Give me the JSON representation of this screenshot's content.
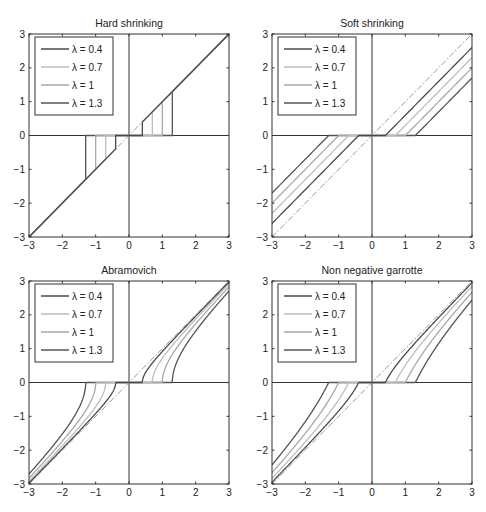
{
  "figure": {
    "layout": {
      "rows": 2,
      "cols": 2
    },
    "legend_labels": [
      "λ = 0.4",
      "λ = 0.7",
      "λ = 1",
      "λ = 1.3"
    ],
    "lambdas": [
      0.4,
      0.7,
      1.0,
      1.3
    ],
    "series_colors": [
      "#4a4a4a",
      "#bdbdbd",
      "#a8a8a8",
      "#555555"
    ],
    "identity_line_color": "#9a9a9a",
    "axis_color": "#333333"
  },
  "chart_data": [
    {
      "type": "line",
      "title": "Hard shrinking",
      "xlabel": "",
      "ylabel": "",
      "xlim": [
        -3,
        3
      ],
      "ylim": [
        -3,
        3
      ],
      "xticks": [
        -3,
        -2,
        -1,
        0,
        1,
        2,
        3
      ],
      "yticks": [
        -3,
        -2,
        -1,
        0,
        1,
        2,
        3
      ],
      "grid": false,
      "legend_position": "upper left",
      "reference_line": {
        "style": "dash-dot",
        "x": [
          -3,
          3
        ],
        "y": [
          -3,
          3
        ]
      },
      "function": "hard",
      "series": [
        {
          "name": "λ = 0.4",
          "x": [
            -3,
            -0.4,
            -0.4,
            0.4,
            0.4,
            3
          ],
          "y": [
            -3,
            -0.4,
            0,
            0,
            0.4,
            3
          ]
        },
        {
          "name": "λ = 0.7",
          "x": [
            -3,
            -0.7,
            -0.7,
            0.7,
            0.7,
            3
          ],
          "y": [
            -3,
            -0.7,
            0,
            0,
            0.7,
            3
          ]
        },
        {
          "name": "λ = 1",
          "x": [
            -3,
            -1,
            -1,
            1,
            1,
            3
          ],
          "y": [
            -3,
            -1,
            0,
            0,
            1,
            3
          ]
        },
        {
          "name": "λ = 1.3",
          "x": [
            -3,
            -1.3,
            -1.3,
            1.3,
            1.3,
            3
          ],
          "y": [
            -3,
            -1.3,
            0,
            0,
            1.3,
            3
          ]
        }
      ]
    },
    {
      "type": "line",
      "title": "Soft shrinking",
      "xlabel": "",
      "ylabel": "",
      "xlim": [
        -3,
        3
      ],
      "ylim": [
        -3,
        3
      ],
      "xticks": [
        -3,
        -2,
        -1,
        0,
        1,
        2,
        3
      ],
      "yticks": [
        -3,
        -2,
        -1,
        0,
        1,
        2,
        3
      ],
      "grid": false,
      "legend_position": "upper left",
      "reference_line": {
        "style": "dash-dot",
        "x": [
          -3,
          3
        ],
        "y": [
          -3,
          3
        ]
      },
      "function": "soft",
      "series": [
        {
          "name": "λ = 0.4",
          "x": [
            -3,
            -0.4,
            0.4,
            3
          ],
          "y": [
            -2.6,
            0,
            0,
            2.6
          ]
        },
        {
          "name": "λ = 0.7",
          "x": [
            -3,
            -0.7,
            0.7,
            3
          ],
          "y": [
            -2.3,
            0,
            0,
            2.3
          ]
        },
        {
          "name": "λ = 1",
          "x": [
            -3,
            -1,
            1,
            3
          ],
          "y": [
            -2.0,
            0,
            0,
            2.0
          ]
        },
        {
          "name": "λ = 1.3",
          "x": [
            -3,
            -1.3,
            1.3,
            3
          ],
          "y": [
            -1.7,
            0,
            0,
            1.7
          ]
        }
      ]
    },
    {
      "type": "line",
      "title": "Abramovich",
      "xlabel": "",
      "ylabel": "",
      "xlim": [
        -3,
        3
      ],
      "ylim": [
        -3,
        3
      ],
      "xticks": [
        -3,
        -2,
        -1,
        0,
        1,
        2,
        3
      ],
      "yticks": [
        -3,
        -2,
        -1,
        0,
        1,
        2,
        3
      ],
      "grid": false,
      "legend_position": "upper left",
      "reference_line": {
        "style": "dash-dot",
        "x": [
          -3,
          3
        ],
        "y": [
          -3,
          3
        ]
      },
      "function": "abramovich",
      "series": [
        {
          "name": "λ = 0.4",
          "x": [
            -3,
            -2,
            -1,
            -0.6,
            -0.4,
            0.4,
            0.6,
            1,
            2,
            3
          ],
          "y": [
            -2.97,
            -1.96,
            -0.92,
            -0.45,
            0,
            0,
            0.45,
            0.92,
            1.96,
            2.97
          ]
        },
        {
          "name": "λ = 0.7",
          "x": [
            -3,
            -2,
            -1,
            -0.8,
            -0.7,
            0.7,
            0.8,
            1,
            2,
            3
          ],
          "y": [
            -2.92,
            -1.87,
            -0.71,
            -0.39,
            0,
            0,
            0.39,
            0.71,
            1.87,
            2.92
          ]
        },
        {
          "name": "λ = 1",
          "x": [
            -3,
            -2,
            -1.5,
            -1.1,
            -1,
            1,
            1.1,
            1.5,
            2,
            3
          ],
          "y": [
            -2.83,
            -1.73,
            -1.12,
            -0.46,
            0,
            0,
            0.46,
            1.12,
            1.73,
            2.83
          ]
        },
        {
          "name": "λ = 1.3",
          "x": [
            -3,
            -2,
            -1.6,
            -1.4,
            -1.3,
            1.3,
            1.4,
            1.6,
            2,
            3
          ],
          "y": [
            -2.7,
            -1.52,
            -0.93,
            -0.52,
            0,
            0,
            0.52,
            0.93,
            1.52,
            2.7
          ]
        }
      ]
    },
    {
      "type": "line",
      "title": "Non negative garrotte",
      "xlabel": "",
      "ylabel": "",
      "xlim": [
        -3,
        3
      ],
      "ylim": [
        -3,
        3
      ],
      "xticks": [
        -3,
        -2,
        -1,
        0,
        1,
        2,
        3
      ],
      "yticks": [
        -3,
        -2,
        -1,
        0,
        1,
        2,
        3
      ],
      "grid": false,
      "legend_position": "upper left",
      "reference_line": {
        "style": "dash-dot",
        "x": [
          -3,
          3
        ],
        "y": [
          -3,
          3
        ]
      },
      "function": "garrote",
      "series": [
        {
          "name": "λ = 0.4",
          "x": [
            -3,
            -2,
            -1,
            -0.4,
            0.4,
            1,
            2,
            3
          ],
          "y": [
            -2.95,
            -1.92,
            -0.84,
            0,
            0,
            0.84,
            1.92,
            2.95
          ]
        },
        {
          "name": "λ = 0.7",
          "x": [
            -3,
            -2,
            -1,
            -0.7,
            0.7,
            1,
            2,
            3
          ],
          "y": [
            -2.84,
            -1.76,
            -0.51,
            0,
            0,
            0.51,
            1.76,
            2.84
          ]
        },
        {
          "name": "λ = 1",
          "x": [
            -3,
            -2,
            -1.5,
            -1,
            1,
            1.5,
            2,
            3
          ],
          "y": [
            -2.67,
            -1.5,
            -0.83,
            0,
            0,
            0.83,
            1.5,
            2.67
          ]
        },
        {
          "name": "λ = 1.3",
          "x": [
            -3,
            -2,
            -1.5,
            -1.3,
            1.3,
            1.5,
            2,
            3
          ],
          "y": [
            -2.44,
            -1.16,
            -0.37,
            0,
            0,
            0.37,
            1.16,
            2.44
          ]
        }
      ]
    }
  ]
}
